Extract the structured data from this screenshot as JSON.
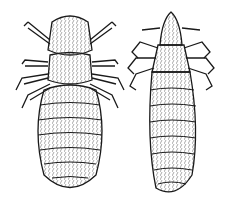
{
  "image": {
    "description": "Black-and-white pen illustration of two lice viewed dorsally",
    "background": "#ffffff",
    "ink": "#1a1a1a",
    "subjects": [
      {
        "name": "left-louse",
        "position": "left",
        "shape": "broad head, wide thorax, oval segmented abdomen, six legs"
      },
      {
        "name": "right-louse",
        "position": "right",
        "shape": "narrow pointed head, clawed legs, elongated segmented abdomen"
      }
    ]
  }
}
